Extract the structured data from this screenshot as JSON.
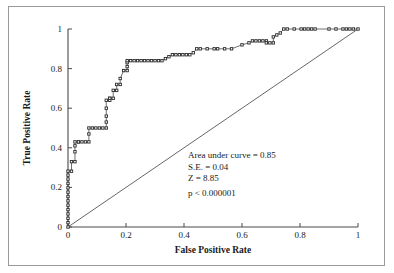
{
  "figure": {
    "background_color": "#ffffff",
    "frame_color": "#9a9a9a",
    "axis_color": "#4a4a4a",
    "curve_color": "#555555",
    "marker_color": "#2b2b2b",
    "diagonal_color": "#555555"
  },
  "annotations": {
    "auc": "Area under curve = 0.85",
    "se": "S.E. = 0.04",
    "z": "Z = 8.85",
    "p": "p < 0.000001"
  },
  "chart_data": {
    "type": "line",
    "title": "",
    "subtitle": "",
    "xlabel": "False Positive Rate",
    "ylabel": "True Positive Rate",
    "xlim": [
      0,
      1
    ],
    "ylim": [
      0,
      1
    ],
    "xticks": [
      0,
      0.2,
      0.4,
      0.6,
      0.8,
      1
    ],
    "xticklabels": [
      "0",
      "0.2",
      "0.4",
      "0.6",
      "0.8",
      "1"
    ],
    "yticks": [
      0,
      0.2,
      0.4,
      0.6,
      0.8,
      1
    ],
    "yticklabels": [
      "0",
      "0.2",
      "0.4",
      "0.6",
      "0.8",
      "1"
    ],
    "grid": false,
    "legend": null,
    "legend_position": "none",
    "marker": "square",
    "series": [
      {
        "name": "ROC curve",
        "marker": "square",
        "line": true,
        "x": [
          0,
          0,
          0,
          0,
          0,
          0,
          0,
          0,
          0,
          0,
          0,
          0,
          0,
          0,
          0.012,
          0.012,
          0.024,
          0.024,
          0.024,
          0.024,
          0.036,
          0.036,
          0.048,
          0.06,
          0.072,
          0.072,
          0.072,
          0.084,
          0.096,
          0.108,
          0.12,
          0.132,
          0.132,
          0.132,
          0.132,
          0.132,
          0.144,
          0.144,
          0.144,
          0.156,
          0.156,
          0.168,
          0.168,
          0.18,
          0.18,
          0.192,
          0.204,
          0.204,
          0.204,
          0.204,
          0.216,
          0.228,
          0.24,
          0.252,
          0.264,
          0.276,
          0.288,
          0.3,
          0.312,
          0.324,
          0.336,
          0.348,
          0.36,
          0.372,
          0.384,
          0.396,
          0.408,
          0.42,
          0.432,
          0.444,
          0.456,
          0.48,
          0.504,
          0.516,
          0.54,
          0.564,
          0.6,
          0.624,
          0.636,
          0.648,
          0.66,
          0.672,
          0.684,
          0.684,
          0.696,
          0.708,
          0.708,
          0.72,
          0.732,
          0.744,
          0.756,
          0.78,
          0.804,
          0.816,
          0.828,
          0.84,
          0.852,
          0.9,
          0.924,
          0.948,
          0.96,
          0.972,
          0.984,
          1.0
        ],
        "y": [
          0,
          0.022,
          0.044,
          0.066,
          0.088,
          0.11,
          0.132,
          0.154,
          0.176,
          0.198,
          0.22,
          0.242,
          0.262,
          0.282,
          0.282,
          0.33,
          0.33,
          0.38,
          0.41,
          0.43,
          0.43,
          0.43,
          0.43,
          0.43,
          0.43,
          0.47,
          0.5,
          0.5,
          0.5,
          0.5,
          0.5,
          0.5,
          0.53,
          0.56,
          0.6,
          0.64,
          0.64,
          0.65,
          0.65,
          0.65,
          0.69,
          0.69,
          0.72,
          0.72,
          0.75,
          0.79,
          0.79,
          0.81,
          0.83,
          0.84,
          0.84,
          0.84,
          0.84,
          0.84,
          0.84,
          0.84,
          0.84,
          0.84,
          0.84,
          0.84,
          0.85,
          0.86,
          0.87,
          0.87,
          0.87,
          0.87,
          0.87,
          0.87,
          0.88,
          0.9,
          0.9,
          0.9,
          0.9,
          0.9,
          0.9,
          0.9,
          0.92,
          0.93,
          0.94,
          0.94,
          0.94,
          0.94,
          0.94,
          0.93,
          0.93,
          0.93,
          0.96,
          0.97,
          0.98,
          1.0,
          1.0,
          1.0,
          1.0,
          1.0,
          1.0,
          1.0,
          1.0,
          1.0,
          1.0,
          1.0,
          1.0,
          1.0,
          1.0,
          1.0
        ]
      },
      {
        "name": "Reference diagonal",
        "marker": "none",
        "line": true,
        "x": [
          0,
          1
        ],
        "y": [
          0,
          1
        ]
      }
    ]
  }
}
